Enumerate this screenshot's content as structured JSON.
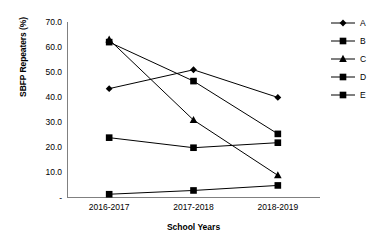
{
  "chart_data": {
    "type": "line",
    "title": "",
    "xlabel": "School Years",
    "ylabel": "SBFP Repeaters (%)",
    "categories": [
      "2016-2017",
      "2017-2018",
      "2018-2019"
    ],
    "ylim": [
      0,
      70
    ],
    "yticks": [
      "-",
      "10.0",
      "20.0",
      "30.0",
      "40.0",
      "50.0",
      "60.0",
      "70.0"
    ],
    "ytick_values": [
      0,
      10,
      20,
      30,
      40,
      50,
      60,
      70
    ],
    "grid": false,
    "legend_position": "right",
    "series": [
      {
        "name": "A",
        "marker": "diamond",
        "values": [
          43.5,
          51.0,
          40.0
        ]
      },
      {
        "name": "B",
        "marker": "square",
        "values": [
          62.0,
          46.5,
          25.5
        ]
      },
      {
        "name": "C",
        "marker": "triangle",
        "values": [
          63.0,
          31.0,
          9.0
        ]
      },
      {
        "name": "D",
        "marker": "square",
        "values": [
          24.0,
          20.0,
          22.0
        ]
      },
      {
        "name": "E",
        "marker": "square",
        "values": [
          1.5,
          3.0,
          5.0
        ]
      }
    ],
    "line_color": "#000000",
    "axis_color": "#808080"
  },
  "axis": {
    "y_title": "SBFP Repeaters (%)",
    "x_title": "School Years",
    "y_ticks": [
      "70.0",
      "60.0",
      "50.0",
      "40.0",
      "30.0",
      "20.0",
      "10.0",
      "-"
    ],
    "x_ticks": [
      "2016-2017",
      "2017-2018",
      "2018-2019"
    ]
  },
  "legend": {
    "items": [
      {
        "label": "A",
        "marker": "diamond-marker-icon"
      },
      {
        "label": "B",
        "marker": "square-marker-icon"
      },
      {
        "label": "C",
        "marker": "triangle-marker-icon"
      },
      {
        "label": "D",
        "marker": "square-marker-icon"
      },
      {
        "label": "E",
        "marker": "square-marker-icon"
      }
    ]
  }
}
